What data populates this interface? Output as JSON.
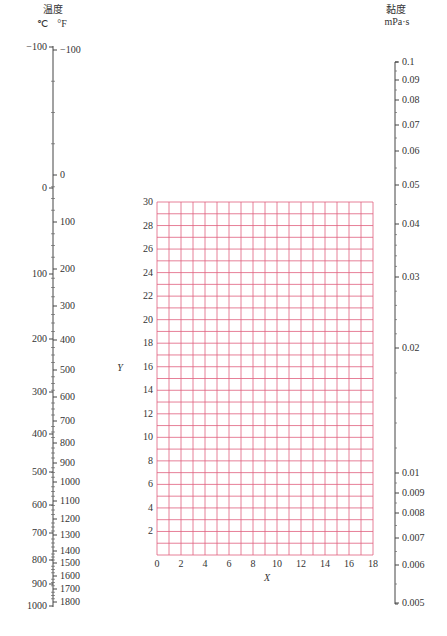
{
  "chart_data": {
    "type": "nomograph",
    "title": "",
    "temperature_axis": {
      "title": "温度",
      "celsius_unit": "℃",
      "fahrenheit_unit": "°F",
      "celsius_ticks": [
        {
          "label": "-100",
          "y": 47
        },
        {
          "label": "0",
          "y": 188
        },
        {
          "label": "100",
          "y": 274
        },
        {
          "label": "200",
          "y": 339
        },
        {
          "label": "300",
          "y": 392
        },
        {
          "label": "400",
          "y": 434
        },
        {
          "label": "500",
          "y": 472
        },
        {
          "label": "600",
          "y": 505
        },
        {
          "label": "700",
          "y": 533
        },
        {
          "label": "800",
          "y": 560
        },
        {
          "label": "900",
          "y": 584
        },
        {
          "label": "1000",
          "y": 606
        }
      ],
      "fahrenheit_ticks": [
        {
          "label": "-100",
          "y": 50
        },
        {
          "label": "0",
          "y": 175
        },
        {
          "label": "100",
          "y": 222
        },
        {
          "label": "200",
          "y": 269
        },
        {
          "label": "300",
          "y": 306
        },
        {
          "label": "400",
          "y": 340
        },
        {
          "label": "500",
          "y": 370
        },
        {
          "label": "600",
          "y": 397
        },
        {
          "label": "700",
          "y": 421
        },
        {
          "label": "800",
          "y": 443
        },
        {
          "label": "900",
          "y": 463
        },
        {
          "label": "1000",
          "y": 482
        },
        {
          "label": "1100",
          "y": 501
        },
        {
          "label": "1200",
          "y": 519
        },
        {
          "label": "1300",
          "y": 535
        },
        {
          "label": "1400",
          "y": 551
        },
        {
          "label": "1500",
          "y": 563
        },
        {
          "label": "1600",
          "y": 576
        },
        {
          "label": "1700",
          "y": 589
        },
        {
          "label": "1800",
          "y": 602
        }
      ]
    },
    "viscosity_axis": {
      "title": "黏度",
      "unit": "mPa·s",
      "ticks": [
        {
          "label": "0.1",
          "y": 62
        },
        {
          "label": "0.09",
          "y": 80
        },
        {
          "label": "0.08",
          "y": 100
        },
        {
          "label": "0.07",
          "y": 125
        },
        {
          "label": "0.06",
          "y": 151
        },
        {
          "label": "0.05",
          "y": 185
        },
        {
          "label": "0.04",
          "y": 224
        },
        {
          "label": "0.03",
          "y": 277
        },
        {
          "label": "0.02",
          "y": 348
        },
        {
          "label": "0.01",
          "y": 473
        },
        {
          "label": "0.009",
          "y": 493
        },
        {
          "label": "0.008",
          "y": 513
        },
        {
          "label": "0.007",
          "y": 538
        },
        {
          "label": "0.006",
          "y": 565
        },
        {
          "label": "0.005",
          "y": 603
        }
      ]
    },
    "grid": {
      "xlabel": "X",
      "ylabel": "Y",
      "x_range": [
        0,
        18
      ],
      "y_range": [
        0,
        30
      ],
      "x_ticks": [
        "0",
        "2",
        "4",
        "6",
        "8",
        "10",
        "12",
        "14",
        "16",
        "18"
      ],
      "y_ticks": [
        "2",
        "4",
        "6",
        "8",
        "10",
        "12",
        "14",
        "16",
        "18",
        "20",
        "22",
        "24",
        "26",
        "28",
        "30"
      ],
      "grid_color": "#e0607e",
      "grid_on": true
    }
  }
}
